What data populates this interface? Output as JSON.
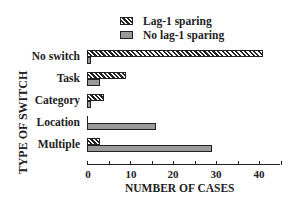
{
  "chart_data": {
    "type": "bar",
    "orientation": "horizontal",
    "title": "",
    "xlabel": "NUMBER OF CASES",
    "ylabel": "TYPE OF SWITCH",
    "categories": [
      "No switch",
      "Task",
      "Category",
      "Location",
      "Multiple"
    ],
    "series": [
      {
        "name": "Lag-1 sparing",
        "pattern": "hatched",
        "values": [
          41,
          9,
          4,
          0,
          3
        ]
      },
      {
        "name": "No lag-1 sparing",
        "pattern": "grey",
        "values": [
          1,
          3,
          1,
          16,
          29
        ]
      }
    ],
    "xlim": [
      0,
      45
    ],
    "xticks": [
      0,
      10,
      20,
      30,
      40
    ],
    "grid": false,
    "legend_position": "top"
  },
  "legend": {
    "items": [
      {
        "label": "Lag-1 sparing"
      },
      {
        "label": "No lag-1 sparing"
      }
    ]
  },
  "axes": {
    "xlabel": "NUMBER OF CASES",
    "ylabel": "TYPE OF SWITCH",
    "ticks": [
      "0",
      "10",
      "20",
      "30",
      "40"
    ]
  },
  "categories": [
    "No switch",
    "Task",
    "Category",
    "Location",
    "Multiple"
  ]
}
